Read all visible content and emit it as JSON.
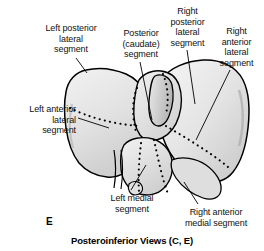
{
  "figure": {
    "panel_letter": "E",
    "caption": "Posteroinferior Views (C, E)"
  },
  "colors": {
    "background": "#ffffff",
    "outline": "#000000",
    "fill_light": "#ededed",
    "fill_mid": "#dcdcdc",
    "fill_shadow": "#bdbdbd",
    "text": "#111111",
    "leader_line": "#000000"
  },
  "labels": [
    {
      "id": "left-posterior-lateral-segment",
      "text": "Left posterior\nlateral\nsegment",
      "align": "center",
      "x": 30,
      "y": 23,
      "width": 82
    },
    {
      "id": "posterior-caudate-segment",
      "text": "Posterior\n(caudate)\nsegment",
      "align": "center",
      "x": 112,
      "y": 28,
      "width": 58
    },
    {
      "id": "right-posterior-lateral-segment",
      "text": "Right\nposterior\nlateral\nsegment",
      "align": "center",
      "x": 163,
      "y": 6,
      "width": 49
    },
    {
      "id": "right-anterior-lateral-segment",
      "text": "Right\nanterior\nlateral\nsegment",
      "align": "center",
      "x": 212,
      "y": 26,
      "width": 49
    },
    {
      "id": "left-anterior-lateral-segment",
      "text": "Left anterior\nlateral\nsegment",
      "align": "right",
      "x": 6,
      "y": 104,
      "width": 70
    },
    {
      "id": "left-medial-segment",
      "text": "Left medial\nsegment",
      "align": "center",
      "x": 99,
      "y": 193,
      "width": 66
    },
    {
      "id": "right-anterior-medial-segment",
      "text": "Right anterior\nmedial segment",
      "align": "center",
      "x": 170,
      "y": 207,
      "width": 92
    }
  ]
}
